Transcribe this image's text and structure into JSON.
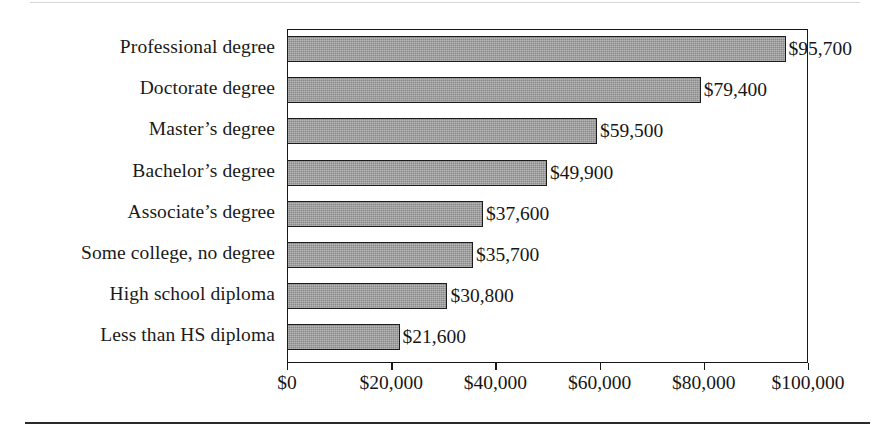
{
  "chart_data": {
    "type": "bar",
    "orientation": "horizontal",
    "title": "",
    "subtitle": "",
    "xlabel": "",
    "ylabel": "",
    "xlim": [
      0,
      100000
    ],
    "grid": false,
    "legend": false,
    "legend_position": "none",
    "bar_color": "#8a8a8a",
    "bar_edge_color": "#1c1c1c",
    "axis_color": "#171717",
    "text_color": "#161616",
    "categories": [
      "Professional degree",
      "Doctorate degree",
      "Master’s degree",
      "Bachelor’s degree",
      "Associate’s degree",
      "Some college, no degree",
      "High school diploma",
      "Less than HS diploma"
    ],
    "values": [
      95700,
      79400,
      59500,
      49900,
      37600,
      35700,
      30800,
      21600
    ],
    "value_labels": [
      "$95,700",
      "$79,400",
      "$59,500",
      "$49,900",
      "$37,600",
      "$35,700",
      "$30,800",
      "$21,600"
    ],
    "x_ticks": [
      0,
      20000,
      40000,
      60000,
      80000,
      100000
    ],
    "x_tick_labels": [
      "$0",
      "$20,000",
      "$40,000",
      "$60,000",
      "$80,000",
      "$100,000"
    ]
  }
}
